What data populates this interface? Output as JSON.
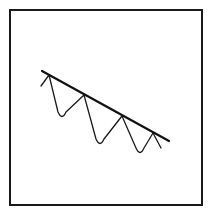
{
  "diagram": {
    "type": "line-drawing",
    "colors": {
      "background": "#ffffff",
      "frame": "#1a1a1a",
      "trendline": "#111111",
      "wave": "#1a1a1a"
    },
    "frame": {
      "x": 10,
      "y": 10,
      "width": 192,
      "height": 195,
      "stroke_width": 2
    },
    "trendline": {
      "start": [
        42,
        71
      ],
      "end": [
        169,
        141
      ],
      "stroke_width": 2.2
    },
    "wave": {
      "stroke_width": 1.3,
      "points": [
        [
          41,
          86
        ],
        [
          49,
          75
        ],
        [
          62,
          118
        ],
        [
          84,
          95
        ],
        [
          100,
          145
        ],
        [
          122,
          116
        ],
        [
          140,
          154
        ],
        [
          153,
          133
        ],
        [
          161,
          148
        ]
      ],
      "touch_points": [
        [
          49,
          75
        ],
        [
          84,
          95
        ],
        [
          122,
          116
        ],
        [
          153,
          133
        ]
      ]
    }
  }
}
